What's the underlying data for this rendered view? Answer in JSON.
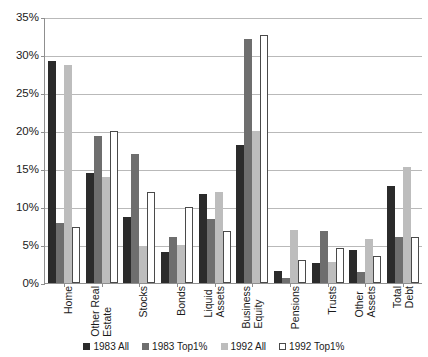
{
  "chart_data": {
    "type": "bar",
    "title": "",
    "xlabel": "",
    "ylabel": "",
    "ylim": [
      0,
      35
    ],
    "ytick_labels": [
      "0%",
      "5%",
      "10%",
      "15%",
      "20%",
      "25%",
      "30%",
      "35%"
    ],
    "ytick_values": [
      0,
      5,
      10,
      15,
      20,
      25,
      30,
      35
    ],
    "grid": true,
    "legend_position": "bottom",
    "categories": [
      "Home",
      "Other Real Estate",
      "Stocks",
      "Bonds",
      "Liquid Assets",
      "Business Equity",
      "Pensions",
      "Trusts",
      "Other Assets",
      "Total Debt"
    ],
    "category_lines": [
      [
        "Home"
      ],
      [
        "Other Real",
        "Estate"
      ],
      [
        "Stocks"
      ],
      [
        "Bonds"
      ],
      [
        "Liquid",
        "Assets"
      ],
      [
        "Business",
        "Equity"
      ],
      [
        "Pensions"
      ],
      [
        "Trusts"
      ],
      [
        "Other",
        "Assets"
      ],
      [
        "Total",
        "Debt"
      ]
    ],
    "series": [
      {
        "name": "1983 All",
        "color": "#2b2b2b",
        "values": [
          29.2,
          14.5,
          8.7,
          4.1,
          11.7,
          18.1,
          1.6,
          2.6,
          4.4,
          12.7
        ]
      },
      {
        "name": "1983 Top1%",
        "color": "#6e6e6e",
        "values": [
          7.9,
          19.4,
          17.0,
          6.0,
          8.4,
          32.1,
          0.7,
          6.9,
          1.4,
          6.0
        ]
      },
      {
        "name": "1992 All",
        "color": "#bdbdbd",
        "values": [
          28.7,
          14.0,
          4.9,
          5.0,
          12.0,
          20.0,
          7.0,
          2.7,
          5.8,
          15.2
        ]
      },
      {
        "name": "1992 Top1%",
        "color": "#ffffff",
        "values": [
          7.4,
          20.0,
          12.0,
          10.0,
          6.8,
          32.6,
          3.0,
          4.6,
          3.5,
          6.0
        ]
      }
    ]
  },
  "legend": {
    "items": [
      {
        "label": "1983 All"
      },
      {
        "label": "1983 Top1%"
      },
      {
        "label": "1992 All"
      },
      {
        "label": "1992 Top1%"
      }
    ]
  }
}
